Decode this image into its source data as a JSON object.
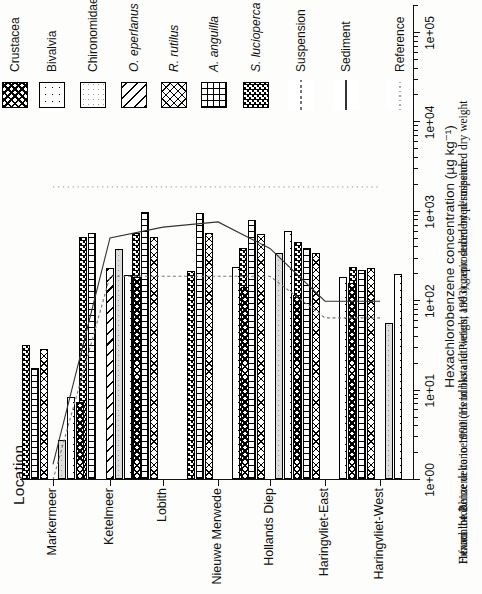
{
  "figure": {
    "page_orientation": "chart rotated 90 degrees counterclockwise on portrait page"
  },
  "caption": {
    "label": "Figure 14.2.",
    "line1": "Hexachlorobenzene concentrations in biota fat weight and organic sedimented/suspended dry weight",
    "line2": "from the Rhine delta in 1990 (Hendriks and Pieters, 1993), reproduced by permission"
  },
  "legend": {
    "items": [
      {
        "label": "Crustacea",
        "italic": false,
        "kind": "patch",
        "key": "crust",
        "pos": 2
      },
      {
        "label": "Bivalvia",
        "italic": false,
        "kind": "patch",
        "key": "biv",
        "pos": 39
      },
      {
        "label": "Chironomidae",
        "italic": false,
        "kind": "patch",
        "key": "chir",
        "pos": 80
      },
      {
        "label": "O. eperlanus",
        "italic": true,
        "kind": "patch",
        "key": "oeper",
        "pos": 121
      },
      {
        "label": "R. rutilus",
        "italic": true,
        "kind": "patch",
        "key": "rrut",
        "pos": 161
      },
      {
        "label": "A. anguilla",
        "italic": true,
        "kind": "patch",
        "key": "aang",
        "pos": 201
      },
      {
        "label": "S. lucioperca",
        "italic": true,
        "kind": "patch",
        "key": "sluc",
        "pos": 243
      },
      {
        "label": "Suspension",
        "italic": false,
        "kind": "line",
        "key": "susp",
        "pos": 288
      },
      {
        "label": "Sediment",
        "italic": false,
        "kind": "line",
        "key": "sed",
        "pos": 333
      },
      {
        "label": "Reference",
        "italic": false,
        "kind": "line",
        "key": "ref",
        "pos": 387
      }
    ]
  },
  "chart_data": {
    "type": "bar",
    "orientation": "grouped horizontal bars (rendered rotated 90° on the page)",
    "xlabel": "Hexachlorobenzene concentration (µg kg⁻¹)",
    "ylabel": "Location",
    "x_scale": "log",
    "x_range": [
      1,
      100000
    ],
    "x_ticks": [
      "1e+00",
      "1e+01",
      "1e+02",
      "1e+03",
      "1e+04",
      "1e+05"
    ],
    "grid": false,
    "legend_position": "right side of unrotated chart (top of page)",
    "categories": [
      "Markermeer",
      "Ketelmeer",
      "Lobith",
      "Nieuwe Merwede",
      "Hollands Diep",
      "Haringvliet-East",
      "Haringvliet-West"
    ],
    "bar_slot_order": [
      "S. lucioperca",
      "A. anguilla",
      "R. rutilus",
      "O. eperlanus",
      "Chironomidae",
      "Bivalvia",
      "Crustacea"
    ],
    "series": [
      {
        "name": "S. lucioperca",
        "key": "sluc",
        "values": [
          32,
          520,
          575,
          220,
          390,
          460,
          240
        ]
      },
      {
        "name": "A. anguilla",
        "key": "aang",
        "values": [
          18,
          580,
          990,
          970,
          810,
          395,
          225
        ]
      },
      {
        "name": "R. rutilus",
        "key": "rrut",
        "values": [
          29,
          null,
          525,
          575,
          560,
          345,
          235
        ]
      },
      {
        "name": "O. eperlanus",
        "key": "oeper",
        "values": [
          null,
          235,
          null,
          null,
          null,
          null,
          null
        ]
      },
      {
        "name": "Chironomidae",
        "key": "chir",
        "values": [
          2.8,
          385,
          null,
          null,
          350,
          null,
          57
        ]
      },
      {
        "name": "Bivalvia",
        "key": "biv",
        "values": [
          8.5,
          195,
          null,
          240,
          610,
          185,
          200
        ]
      },
      {
        "name": "Crustacea",
        "key": "crust",
        "values": [
          7.4,
          185,
          null,
          145,
          117,
          160,
          null
        ]
      }
    ],
    "lines": [
      {
        "name": "Suspension",
        "key": "susp",
        "values": [
          1.0,
          190,
          190,
          190,
          190,
          65,
          65
        ]
      },
      {
        "name": "Sediment",
        "key": "sed",
        "values": [
          1.5,
          510,
          675,
          770,
          390,
          100,
          100
        ]
      },
      {
        "name": "Reference",
        "key": "ref",
        "values": [
          1900,
          1900,
          1900,
          1900,
          1900,
          1900,
          1900
        ]
      }
    ],
    "ink_color": "#111111",
    "chironomidae_fill": "#dcdcdc",
    "background": "#fdfdfb"
  }
}
